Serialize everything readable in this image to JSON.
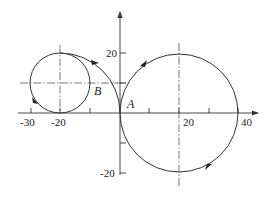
{
  "diagram": {
    "type": "trajectory-diagram",
    "colors": {
      "line": "#333333",
      "centerline": "#555555",
      "background": "#ffffff"
    },
    "axes": {
      "x": {
        "ticks": [
          -30,
          -20,
          -10,
          0,
          10,
          20,
          30,
          40
        ],
        "labels": [
          "-30",
          "-20",
          "20",
          "40"
        ]
      },
      "y": {
        "ticks": [
          -20,
          -10,
          10,
          20
        ],
        "labels": [
          "20",
          "-20"
        ]
      }
    },
    "points": {
      "A": {
        "label": "A",
        "x": 0,
        "y": 0
      },
      "B": {
        "label": "B"
      }
    },
    "shapes": {
      "small_circle": {
        "center": [
          -20,
          10
        ],
        "radius": 10
      },
      "tangent_arc": {
        "center": [
          -20,
          0
        ],
        "radius": 20,
        "from": [
          -20,
          20
        ],
        "to": [
          0,
          0
        ]
      },
      "large_circle": {
        "center": [
          20,
          0
        ],
        "radius": 20
      }
    }
  }
}
